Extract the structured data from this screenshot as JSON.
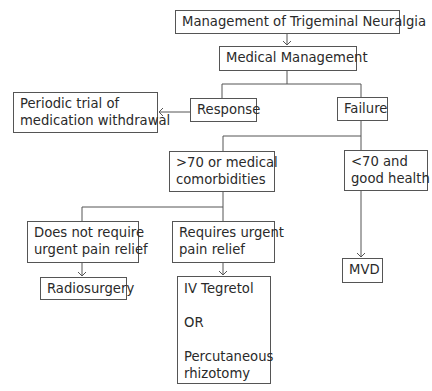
{
  "diagram": {
    "title": "Management of Trigeminal Neuralgia",
    "nodes": {
      "root": {
        "lines": [
          "Management of Trigeminal Neuralgia"
        ]
      },
      "medical": {
        "lines": [
          "Medical Management"
        ]
      },
      "response": {
        "lines": [
          "Response"
        ]
      },
      "failure": {
        "lines": [
          "Failure"
        ]
      },
      "periodic": {
        "lines": [
          "Periodic trial of",
          "medication withdrawal"
        ]
      },
      "over70": {
        "lines": [
          ">70 or medical",
          "comorbidities"
        ]
      },
      "under70": {
        "lines": [
          "<70 and",
          "good health"
        ]
      },
      "no_urgent": {
        "lines": [
          "Does not require",
          "urgent pain relief"
        ]
      },
      "urgent": {
        "lines": [
          "Requires urgent",
          "pain relief"
        ]
      },
      "radiosurgery": {
        "lines": [
          "Radiosurgery"
        ]
      },
      "iv_tegretol": {
        "lines": [
          "IV Tegretol",
          "OR",
          "Percutaneous",
          "rhizotomy"
        ]
      },
      "mvd": {
        "lines": [
          "MVD"
        ]
      }
    },
    "edges": [
      {
        "from": "root",
        "to": "medical",
        "arrow": true
      },
      {
        "from": "medical",
        "to": "response",
        "arrow": false
      },
      {
        "from": "medical",
        "to": "failure",
        "arrow": false
      },
      {
        "from": "response",
        "to": "periodic",
        "arrow": true
      },
      {
        "from": "failure",
        "to": "over70",
        "arrow": false
      },
      {
        "from": "failure",
        "to": "under70",
        "arrow": false
      },
      {
        "from": "over70",
        "to": "no_urgent",
        "arrow": false
      },
      {
        "from": "over70",
        "to": "urgent",
        "arrow": false
      },
      {
        "from": "no_urgent",
        "to": "radiosurgery",
        "arrow": true
      },
      {
        "from": "urgent",
        "to": "iv_tegretol",
        "arrow": true
      },
      {
        "from": "under70",
        "to": "mvd",
        "arrow": true
      }
    ]
  }
}
